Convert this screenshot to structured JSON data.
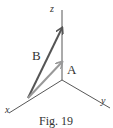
{
  "diagram": {
    "axes": {
      "z_label": "z",
      "x_label": "x",
      "y_label": "y"
    },
    "vectors": [
      {
        "label": "B",
        "color": "#555555"
      },
      {
        "label": "A",
        "color": "#999999"
      }
    ],
    "caption": "Fig. 19"
  }
}
